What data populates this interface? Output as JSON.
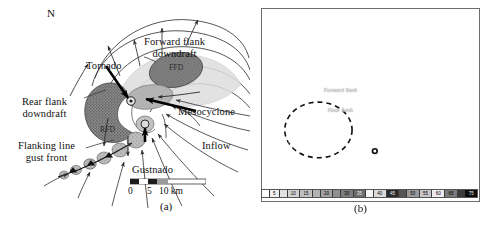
{
  "figure": {
    "panels": [
      {
        "id": "a",
        "caption": "(a)",
        "type": "schematic-diagram",
        "description": "Plan-view schematic of a classic supercell thunderstorm",
        "compass": {
          "label": "N",
          "icon": "north-arrow-icon"
        },
        "labels": [
          {
            "name": "tornado",
            "text": "Tornado"
          },
          {
            "name": "forward-flank-downdraft",
            "text": "Forward flank\ndowndraft"
          },
          {
            "name": "ffd-abbrev",
            "text": "FFD"
          },
          {
            "name": "rear-flank-downdraft",
            "text": "Rear flank\ndowndraft"
          },
          {
            "name": "rfd-abbrev",
            "text": "RFD"
          },
          {
            "name": "mesocyclone",
            "text": "Mesocyclone"
          },
          {
            "name": "flanking-line-gust-front",
            "text": "Flanking line\ngust front"
          },
          {
            "name": "gustnado",
            "text": "Gustnado"
          },
          {
            "name": "inflow",
            "text": "Inflow"
          }
        ],
        "scalebar": {
          "ticks": [
            "0",
            "5",
            "10"
          ],
          "units": "km",
          "text": "0      5   10 km"
        }
      },
      {
        "id": "b",
        "caption": "(b)",
        "type": "radar-reflectivity-image",
        "description": "Grayscale WSR-88D radar reflectivity image of a supercell with hook echo",
        "annotations": [
          {
            "name": "forward-flank-annotation",
            "text": "Forward flank"
          },
          {
            "name": "rear-flank-annotation",
            "text": "Rear flank"
          }
        ],
        "colorbar": {
          "name": "reflectivity-colorbar",
          "units": "dBZ",
          "labels": [
            "",
            "5",
            "",
            "10",
            "15",
            "",
            "20",
            "",
            "30",
            "35",
            "",
            "40",
            "45",
            "",
            "50",
            "55",
            "60",
            "65",
            "",
            "75"
          ]
        }
      }
    ]
  },
  "colors": {
    "ink": "#111111",
    "ffd_fill": "#8f8f8f",
    "rfd_fill": "#7d7d7d",
    "updraft_fill": "#b9b9b9",
    "flanking_cell_fill": "#a8a8a8",
    "outline": "#2b2b2b",
    "radar_background": "#c9c9c9"
  }
}
